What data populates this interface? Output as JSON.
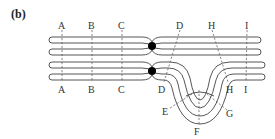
{
  "panel_label": "(b)",
  "diagram": {
    "top_labels": [
      "A",
      "B",
      "C",
      "D",
      "H",
      "I"
    ],
    "bottom_labels": [
      "A",
      "B",
      "C",
      "D",
      "H",
      "I"
    ],
    "loop_labels": [
      "E",
      "F",
      "G"
    ],
    "centromere_color": "#000000",
    "line_color": "#444444"
  }
}
